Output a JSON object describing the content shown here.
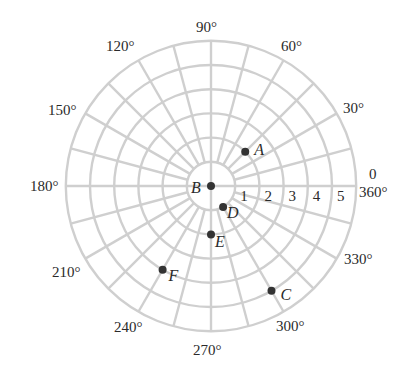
{
  "diagram": {
    "type": "polar-grid",
    "center_px": [
      211,
      186
    ],
    "ring_spacing_px": 24.2,
    "ring_count": 6,
    "spoke_step_deg": 15,
    "grid_color": "#cfcfcf",
    "point_color": "#333333",
    "radial_labels": [
      "1",
      "2",
      "3",
      "4",
      "5"
    ],
    "angle_labels": [
      {
        "text": "90°",
        "x": 196,
        "y": 20
      },
      {
        "text": "60°",
        "x": 281,
        "y": 39
      },
      {
        "text": "120°",
        "x": 106,
        "y": 39
      },
      {
        "text": "30°",
        "x": 343,
        "y": 101
      },
      {
        "text": "150°",
        "x": 48,
        "y": 103
      },
      {
        "text": "0",
        "x": 369,
        "y": 167
      },
      {
        "text": "360°",
        "x": 359,
        "y": 185
      },
      {
        "text": "180°",
        "x": 30,
        "y": 179
      },
      {
        "text": "330°",
        "x": 344,
        "y": 252
      },
      {
        "text": "210°",
        "x": 52,
        "y": 265
      },
      {
        "text": "300°",
        "x": 276,
        "y": 319
      },
      {
        "text": "240°",
        "x": 114,
        "y": 320
      },
      {
        "text": "270°",
        "x": 193,
        "y": 343
      }
    ],
    "points": [
      {
        "label": "A",
        "r": 2,
        "theta_deg": 45,
        "label_dx": 9,
        "label_dy": -8
      },
      {
        "label": "B",
        "r": 0,
        "theta_deg": 0,
        "label_dx": -20,
        "label_dy": -4
      },
      {
        "label": "C",
        "r": 5,
        "theta_deg": 300,
        "label_dx": 9,
        "label_dy": -2
      },
      {
        "label": "D",
        "r": 1,
        "theta_deg": 300,
        "label_dx": 4,
        "label_dy": 0
      },
      {
        "label": "E",
        "r": 2,
        "theta_deg": 270,
        "label_dx": 4,
        "label_dy": 2
      },
      {
        "label": "F",
        "r": 4,
        "theta_deg": 240,
        "label_dx": 6,
        "label_dy": 0
      }
    ]
  }
}
